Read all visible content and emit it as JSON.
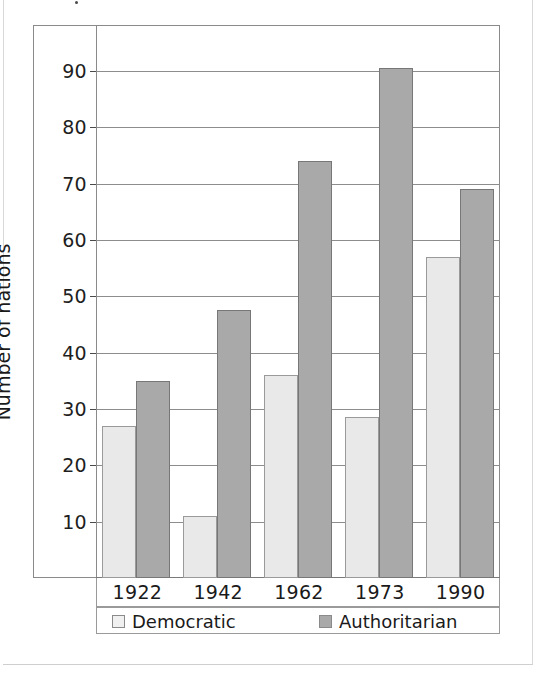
{
  "chart_data": {
    "type": "bar",
    "title": "",
    "xlabel": "",
    "ylabel": "Number of nations",
    "categories": [
      "1922",
      "1942",
      "1962",
      "1973",
      "1990"
    ],
    "series": [
      {
        "name": "Democratic",
        "color": "#e9e9e9",
        "values": [
          27,
          11,
          36,
          28.5,
          57
        ]
      },
      {
        "name": "Authoritarian",
        "color": "#a9a9a9",
        "values": [
          35,
          47.5,
          74,
          90.5,
          69
        ]
      }
    ],
    "ylim": [
      0,
      98
    ],
    "yticks": [
      10,
      20,
      30,
      40,
      50,
      60,
      70,
      80,
      90
    ],
    "ytick_labels": [
      "10",
      "20",
      "30",
      "40",
      "50",
      "60",
      "70",
      "80",
      "90"
    ],
    "grid": true,
    "legend_position": "bottom"
  },
  "legend": {
    "items": [
      {
        "label": "Democratic",
        "swatch": "democratic-swatch"
      },
      {
        "label": "Authoritarian",
        "swatch": "authoritarian-swatch"
      }
    ]
  }
}
